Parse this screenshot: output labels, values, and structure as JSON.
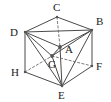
{
  "figure": {
    "kind": "geometry-diagram",
    "width": 111,
    "height": 102,
    "background_color": "#ffffff",
    "line_color": "#4a4a4a",
    "dashed_line_color": "#6b6b6b",
    "label_color": "#1a1a1a",
    "point_marker_color": "#555555"
  },
  "labels": {
    "C": "C",
    "B": "B",
    "D": "D",
    "A": "A",
    "G": "G",
    "F": "F",
    "H": "H",
    "E": "E"
  },
  "vertices": [
    {
      "id": "C",
      "label": "C",
      "x": 57,
      "y": 17,
      "label_x": 53,
      "label_y": 11,
      "marked": false
    },
    {
      "id": "B",
      "label": "B",
      "x": 92,
      "y": 30,
      "label_x": 96,
      "label_y": 25,
      "marked": false
    },
    {
      "id": "D",
      "label": "D",
      "x": 25,
      "y": 32,
      "label_x": 10,
      "label_y": 36,
      "marked": false
    },
    {
      "id": "A",
      "label": "A",
      "x": 60,
      "y": 47,
      "label_x": 65,
      "label_y": 53,
      "marked": true
    },
    {
      "id": "G",
      "label": "G",
      "x": 52,
      "y": 56,
      "label_x": 48,
      "label_y": 68,
      "marked": true
    },
    {
      "id": "F",
      "label": "F",
      "x": 92,
      "y": 66,
      "label_x": 96,
      "label_y": 70,
      "marked": false
    },
    {
      "id": "H",
      "label": "H",
      "x": 25,
      "y": 72,
      "label_x": 11,
      "label_y": 76,
      "marked": false
    },
    {
      "id": "E",
      "label": "E",
      "x": 62,
      "y": 86,
      "label_x": 58,
      "label_y": 99,
      "marked": false
    }
  ],
  "edges_solid": [
    {
      "from": "D",
      "to": "C"
    },
    {
      "from": "C",
      "to": "B"
    },
    {
      "from": "D",
      "to": "B"
    },
    {
      "from": "D",
      "to": "H"
    },
    {
      "from": "B",
      "to": "F"
    },
    {
      "from": "H",
      "to": "E"
    },
    {
      "from": "E",
      "to": "F"
    },
    {
      "from": "D",
      "to": "A"
    },
    {
      "from": "B",
      "to": "A"
    },
    {
      "from": "D",
      "to": "G"
    },
    {
      "from": "B",
      "to": "G"
    },
    {
      "from": "E",
      "to": "D"
    },
    {
      "from": "E",
      "to": "B"
    },
    {
      "from": "E",
      "to": "A"
    },
    {
      "from": "E",
      "to": "G"
    },
    {
      "from": "A",
      "to": "G"
    }
  ],
  "edges_dashed": [
    {
      "from": "C",
      "to": "A"
    },
    {
      "from": "H",
      "to": "G"
    },
    {
      "from": "G",
      "to": "F"
    },
    {
      "from": "A",
      "to": "G"
    }
  ]
}
